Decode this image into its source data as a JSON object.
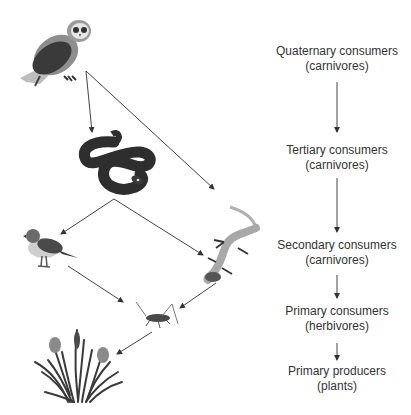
{
  "diagram": {
    "type": "food-web",
    "organisms": [
      {
        "id": "owl",
        "name": "Owl",
        "level": "Quaternary consumer"
      },
      {
        "id": "snake",
        "name": "Snake",
        "level": "Tertiary consumer"
      },
      {
        "id": "bird",
        "name": "Bird",
        "level": "Secondary consumer"
      },
      {
        "id": "lizard",
        "name": "Lizard",
        "level": "Secondary consumer"
      },
      {
        "id": "grasshopper",
        "name": "Grasshopper",
        "level": "Primary consumer"
      },
      {
        "id": "plants",
        "name": "Plants",
        "level": "Primary producer"
      }
    ],
    "edges": [
      {
        "from": "owl",
        "to": "snake"
      },
      {
        "from": "owl",
        "to": "lizard"
      },
      {
        "from": "snake",
        "to": "bird"
      },
      {
        "from": "snake",
        "to": "lizard"
      },
      {
        "from": "bird",
        "to": "grasshopper"
      },
      {
        "from": "lizard",
        "to": "grasshopper"
      },
      {
        "from": "grasshopper",
        "to": "plants"
      }
    ]
  },
  "levels": [
    {
      "title": "Quaternary consumers",
      "subtitle": "(carnivores)"
    },
    {
      "title": "Tertiary consumers",
      "subtitle": "(carnivores)"
    },
    {
      "title": "Secondary consumers",
      "subtitle": "(carnivores)"
    },
    {
      "title": "Primary consumers",
      "subtitle": "(herbivores)"
    },
    {
      "title": "Primary producers",
      "subtitle": "(plants)"
    }
  ],
  "colors": {
    "arrow": "#333333",
    "text": "#333333",
    "dark": "#3a3a3a",
    "mid": "#8a8a8a",
    "light": "#bdbdbd"
  }
}
